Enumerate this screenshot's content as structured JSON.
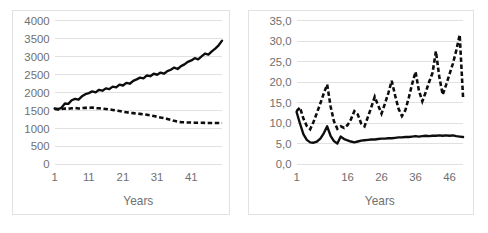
{
  "figure": {
    "panels": [
      "left",
      "right"
    ]
  },
  "chart_data": [
    {
      "panel": "left",
      "type": "line",
      "title": "",
      "xlabel": "Years",
      "ylabel": "",
      "grid": true,
      "legend": "none",
      "xlim": [
        1,
        50
      ],
      "ylim": [
        0,
        4000
      ],
      "ytick_labels": [
        "4000",
        "3500",
        "3000",
        "2500",
        "2000",
        "1500",
        "1000",
        "500",
        "0"
      ],
      "ytick_values": [
        4000,
        3500,
        3000,
        2500,
        2000,
        1500,
        1000,
        500,
        0
      ],
      "xtick_labels": [
        "1",
        "11",
        "21",
        "31",
        "41"
      ],
      "xtick_values": [
        1,
        11,
        21,
        31,
        41
      ],
      "x": [
        1,
        2,
        3,
        4,
        5,
        6,
        7,
        8,
        9,
        10,
        11,
        12,
        13,
        14,
        15,
        16,
        17,
        18,
        19,
        20,
        21,
        22,
        23,
        24,
        25,
        26,
        27,
        28,
        29,
        30,
        31,
        32,
        33,
        34,
        35,
        36,
        37,
        38,
        39,
        40,
        41,
        42,
        43,
        44,
        45,
        46,
        47,
        48,
        49,
        50
      ],
      "series": [
        {
          "name": "solid-series",
          "style": "solid",
          "values": [
            1560,
            1545,
            1580,
            1700,
            1690,
            1790,
            1830,
            1805,
            1900,
            1960,
            1990,
            2035,
            2010,
            2080,
            2055,
            2120,
            2100,
            2170,
            2150,
            2225,
            2200,
            2275,
            2250,
            2330,
            2370,
            2420,
            2400,
            2480,
            2460,
            2530,
            2500,
            2560,
            2530,
            2600,
            2640,
            2700,
            2660,
            2740,
            2790,
            2860,
            2900,
            2960,
            2930,
            3010,
            3090,
            3060,
            3150,
            3230,
            3320,
            3450
          ]
        },
        {
          "name": "dashed-series",
          "style": "dashed",
          "values": [
            1545,
            1530,
            1545,
            1560,
            1550,
            1565,
            1575,
            1560,
            1570,
            1580,
            1575,
            1585,
            1570,
            1565,
            1555,
            1545,
            1535,
            1520,
            1505,
            1490,
            1470,
            1455,
            1440,
            1430,
            1420,
            1410,
            1400,
            1385,
            1370,
            1350,
            1330,
            1310,
            1295,
            1270,
            1245,
            1215,
            1195,
            1180,
            1175,
            1170,
            1168,
            1165,
            1163,
            1162,
            1160,
            1158,
            1157,
            1156,
            1155,
            1155
          ]
        }
      ]
    },
    {
      "panel": "right",
      "type": "line",
      "title": "",
      "xlabel": "Years",
      "ylabel": "",
      "grid": true,
      "legend": "none",
      "xlim": [
        1,
        50
      ],
      "ylim": [
        0,
        35
      ],
      "ytick_labels": [
        "35,0",
        "30,0",
        "25,0",
        "20,0",
        "15,0",
        "10,0",
        "5,0",
        "0,0"
      ],
      "ytick_values": [
        35,
        30,
        25,
        20,
        15,
        10,
        5,
        0
      ],
      "xtick_labels": [
        "1",
        "16",
        "26",
        "36",
        "46"
      ],
      "xtick_values": [
        1,
        16,
        26,
        36,
        46
      ],
      "x": [
        1,
        2,
        3,
        4,
        5,
        6,
        7,
        8,
        9,
        10,
        11,
        12,
        13,
        14,
        15,
        16,
        17,
        18,
        19,
        20,
        21,
        22,
        23,
        24,
        25,
        26,
        27,
        28,
        29,
        30,
        31,
        32,
        33,
        34,
        35,
        36,
        37,
        38,
        39,
        40,
        41,
        42,
        43,
        44,
        45,
        46,
        47,
        48,
        49,
        50
      ],
      "series": [
        {
          "name": "solid-series",
          "style": "solid",
          "values": [
            12.8,
            10.0,
            7.4,
            6.0,
            5.4,
            5.3,
            5.6,
            6.3,
            7.6,
            9.3,
            7.0,
            5.7,
            5.1,
            6.8,
            6.2,
            5.9,
            5.6,
            5.4,
            5.6,
            5.8,
            5.9,
            6.0,
            6.1,
            6.1,
            6.2,
            6.3,
            6.3,
            6.4,
            6.4,
            6.5,
            6.6,
            6.6,
            6.7,
            6.7,
            6.8,
            6.9,
            6.8,
            6.9,
            7.0,
            6.9,
            7.0,
            7.0,
            7.1,
            7.0,
            7.1,
            7.0,
            7.1,
            6.9,
            6.8,
            6.7
          ]
        },
        {
          "name": "dashed-series",
          "style": "dashed",
          "values": [
            13.0,
            13.9,
            11.2,
            9.4,
            8.6,
            10.4,
            12.6,
            14.9,
            17.3,
            19.5,
            14.2,
            10.5,
            8.7,
            9.3,
            8.9,
            9.6,
            11.0,
            13.0,
            12.2,
            10.0,
            9.3,
            11.6,
            14.0,
            16.5,
            14.4,
            12.4,
            14.8,
            17.4,
            20.4,
            16.8,
            13.6,
            11.8,
            13.2,
            16.2,
            19.6,
            22.6,
            18.0,
            15.4,
            17.6,
            20.1,
            22.3,
            27.6,
            21.4,
            17.0,
            19.4,
            22.0,
            24.6,
            27.8,
            31.6,
            16.2
          ]
        }
      ]
    }
  ]
}
